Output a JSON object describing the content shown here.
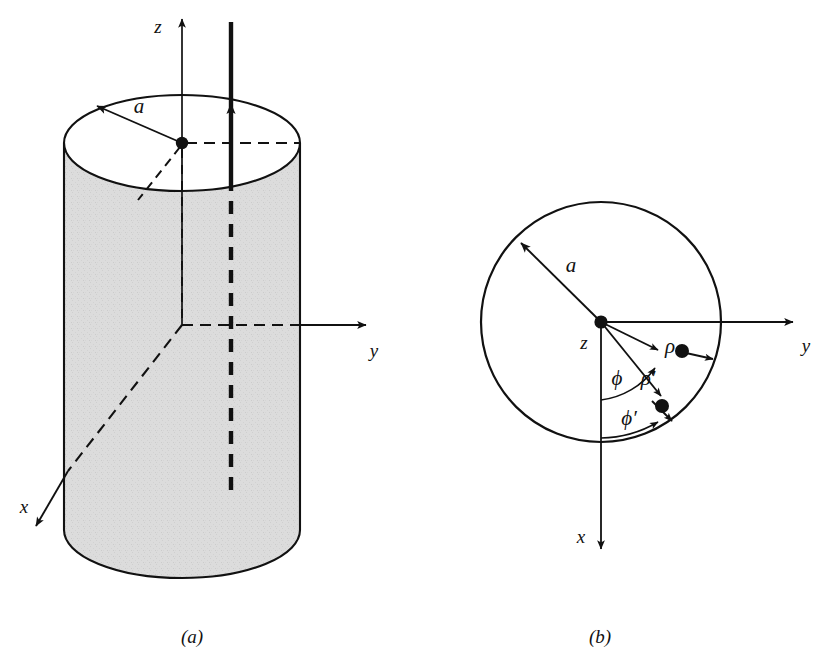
{
  "figure": {
    "background_color": "#ffffff",
    "ink_color": "#111111",
    "shading_color": "#d9d9d9",
    "panels": [
      {
        "id": "a",
        "caption": "(a)"
      },
      {
        "id": "b",
        "caption": "(b)"
      }
    ]
  },
  "panel_a": {
    "caption": "(a)",
    "description": "Shaded cylinder of radius a with z axis up through its center, y axis to the right, x axis toward the viewer, and a thick current-carrying wire parallel to z inside the cylinder.",
    "labels": {
      "z_axis": "z",
      "y_axis": "y",
      "x_axis": "x",
      "radius": "a"
    },
    "geometry": {
      "cylinder_center_x": 182,
      "cylinder_top_center_y": 143,
      "cylinder_radius_x": 118,
      "cylinder_radius_y": 48,
      "cylinder_bottom_center_y": 530,
      "origin_x": 182,
      "origin_y": 325,
      "wire_x": 231
    }
  },
  "panel_b": {
    "caption": "(b)",
    "description": "End-on view of the cylinder: a circle of radius a centered on the z axis, with field point at polar coordinates (rho, phi) and source point at (rho-prime, phi-prime) measured from the x axis.",
    "labels": {
      "z_axis": "z",
      "y_axis": "y",
      "x_axis": "x",
      "radius": "a",
      "rho": "ρ",
      "rho_prime": "ρ′",
      "phi": "ϕ",
      "phi_prime": "ϕ′"
    },
    "geometry": {
      "circle_center_x": 601,
      "circle_center_y": 322,
      "circle_radius": 120,
      "field_point_x": 682,
      "field_point_y": 351,
      "source_point_x": 662,
      "source_point_y": 406
    }
  }
}
